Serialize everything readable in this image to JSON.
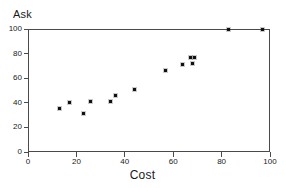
{
  "chart_data": {
    "type": "scatter",
    "title": "",
    "xlabel": "Cost",
    "ylabel": "Ask",
    "xlim": [
      0,
      100
    ],
    "ylim": [
      0,
      100
    ],
    "xticks": [
      0,
      20,
      40,
      60,
      80,
      100
    ],
    "yticks": [
      0,
      20,
      40,
      60,
      80,
      100
    ],
    "grid": false,
    "legend": null,
    "marker": "dot",
    "marker_color": "#111111",
    "frame_color": "#4a4a4a",
    "background": "#ffffff",
    "points": [
      {
        "x": 13,
        "y": 35
      },
      {
        "x": 17,
        "y": 40
      },
      {
        "x": 23,
        "y": 31
      },
      {
        "x": 26,
        "y": 41
      },
      {
        "x": 34,
        "y": 41
      },
      {
        "x": 36,
        "y": 46
      },
      {
        "x": 44,
        "y": 51
      },
      {
        "x": 57,
        "y": 66
      },
      {
        "x": 64,
        "y": 71
      },
      {
        "x": 67,
        "y": 77
      },
      {
        "x": 68,
        "y": 72
      },
      {
        "x": 69,
        "y": 77
      },
      {
        "x": 83,
        "y": 100
      },
      {
        "x": 97,
        "y": 100
      }
    ]
  }
}
